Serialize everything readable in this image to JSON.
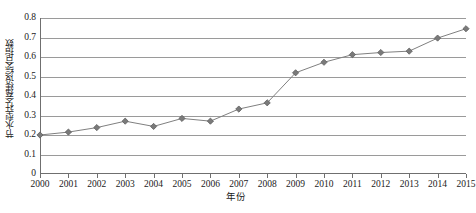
{
  "chart_data": {
    "type": "line",
    "title": "",
    "xlabel": "年份",
    "ylabel": "节水型社会建设综合指数",
    "categories": [
      "2000",
      "2001",
      "2002",
      "2003",
      "2004",
      "2005",
      "2006",
      "2007",
      "2008",
      "2009",
      "2010",
      "2011",
      "2012",
      "2013",
      "2014",
      "2015"
    ],
    "x": [
      2000,
      2001,
      2002,
      2003,
      2004,
      2005,
      2006,
      2007,
      2008,
      2009,
      2010,
      2011,
      2012,
      2013,
      2014,
      2015
    ],
    "values": [
      0.2,
      0.215,
      0.238,
      0.271,
      0.244,
      0.285,
      0.271,
      0.333,
      0.365,
      0.519,
      0.573,
      0.612,
      0.623,
      0.63,
      0.697,
      0.745
    ],
    "series": [
      {
        "name": "节水型社会建设综合指数",
        "values": [
          0.2,
          0.215,
          0.238,
          0.271,
          0.244,
          0.285,
          0.271,
          0.333,
          0.365,
          0.519,
          0.573,
          0.612,
          0.623,
          0.63,
          0.697,
          0.745
        ]
      }
    ],
    "ylim": [
      0,
      0.8
    ],
    "xlim": [
      2000,
      2015
    ],
    "yticks": [
      0,
      0.1,
      0.2,
      0.3,
      0.4,
      0.5,
      0.6,
      0.7,
      0.8
    ],
    "ytick_labels": [
      "0",
      "0.1",
      "0.2",
      "0.3",
      "0.4",
      "0.5",
      "0.6",
      "0.7",
      "0.8"
    ],
    "grid": "horizontal",
    "legend": "none",
    "marker": "diamond",
    "line_color": "#808080",
    "marker_color": "#7a7a7a",
    "grid_color": "#9a9a9a"
  }
}
